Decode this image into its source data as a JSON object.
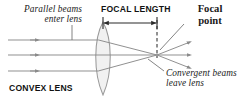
{
  "diagram": {
    "subject": "CONVEX LENS",
    "labels": {
      "parallel_beams": "Parallel beams\nenter lens",
      "focal_length": "FOCAL LENGTH",
      "focal_point": "Focal\npoint",
      "convergent_beams": "Convergent beams\nleave lens",
      "convex_lens": "CONVEX LENS"
    },
    "colors": {
      "background": "#ffffff",
      "text": "#1a1a1a",
      "ray_line": "#8a8a8a",
      "lens_outline": "#9a9a9a",
      "lens_fill": "#f0f0f0",
      "dashed_line": "#6e6e6e",
      "arrow_line": "#2a2a2a",
      "leader_line": "#6e6e6e"
    },
    "geometry": {
      "optical_axis_y": 55,
      "lens_center_x": 103,
      "lens_half_width": 10,
      "lens_top_y": 22,
      "lens_bottom_y": 95,
      "focal_point_x": 157,
      "focal_point_y": 55,
      "focal_length_px": 54,
      "incoming_ray_y_values": [
        40,
        55,
        71
      ],
      "incoming_ray_start_x": 8,
      "outgoing_ray_end_x": 193,
      "outgoing_ray_end_y_values": [
        42,
        55,
        68
      ]
    },
    "elements": {
      "lens": "biconvex-lens",
      "rays_in": 3,
      "rays_out": 3,
      "dashed_marker": "focal-plane-dashed-line",
      "measure_arrow": "double-headed-arrow"
    }
  }
}
